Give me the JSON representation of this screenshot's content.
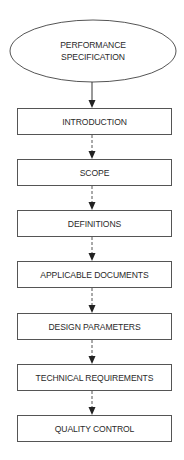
{
  "diagram": {
    "type": "flowchart",
    "start": {
      "shape": "ellipse",
      "lines": [
        "PERFORMANCE",
        "SPECIFICATION"
      ]
    },
    "steps": [
      {
        "label": "INTRODUCTION",
        "top": 108
      },
      {
        "label": "SCOPE",
        "top": 159
      },
      {
        "label": "DEFINITIONS",
        "top": 210
      },
      {
        "label": "APPLICABLE DOCUMENTS",
        "top": 261
      },
      {
        "label": "DESIGN PARAMETERS",
        "top": 313
      },
      {
        "label": "TECHNICAL REQUIREMENTS",
        "top": 364
      },
      {
        "label": "QUALITY CONTROL",
        "top": 415
      }
    ],
    "connectors": [
      {
        "from": "PERFORMANCE SPECIFICATION",
        "to": "INTRODUCTION",
        "style": "solid"
      },
      {
        "from": "INTRODUCTION",
        "to": "SCOPE",
        "style": "dashed"
      },
      {
        "from": "SCOPE",
        "to": "DEFINITIONS",
        "style": "dashed"
      },
      {
        "from": "DEFINITIONS",
        "to": "APPLICABLE DOCUMENTS",
        "style": "dashed"
      },
      {
        "from": "APPLICABLE DOCUMENTS",
        "to": "DESIGN PARAMETERS",
        "style": "dashed"
      },
      {
        "from": "DESIGN PARAMETERS",
        "to": "TECHNICAL REQUIREMENTS",
        "style": "dashed"
      },
      {
        "from": "TECHNICAL REQUIREMENTS",
        "to": "QUALITY CONTROL",
        "style": "dashed"
      }
    ]
  }
}
